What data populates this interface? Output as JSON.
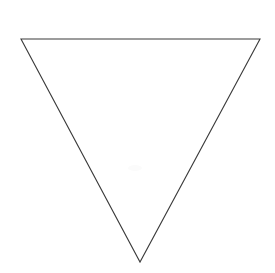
{
  "canvas": {
    "width": 275,
    "height": 273,
    "background_color": "#ffffff",
    "description": "Scanned line drawing of a single inverted triangle on a blank white page"
  },
  "figure": {
    "name": "inverted-triangle",
    "shape_type": "triangle",
    "orientation": "point-down",
    "stroke_color": "#3b3b3b",
    "stroke_width": 1.1,
    "fill_color": "none",
    "vertices": [
      {
        "label": "top-left",
        "x": 21,
        "y": 39
      },
      {
        "label": "top-right",
        "x": 260,
        "y": 39
      },
      {
        "label": "bottom-apex",
        "x": 140,
        "y": 262
      }
    ],
    "points_attribute": "21,39 260,39 140,262",
    "measurements": {
      "base_width": 239,
      "height": 223,
      "base_y": 39,
      "apex_x": 140,
      "apex_y": 262
    }
  },
  "artifacts": [
    {
      "name": "scan-smudge",
      "x": 128,
      "y": 165,
      "width": 14,
      "height": 6,
      "color": "#fbfbfb"
    }
  ]
}
